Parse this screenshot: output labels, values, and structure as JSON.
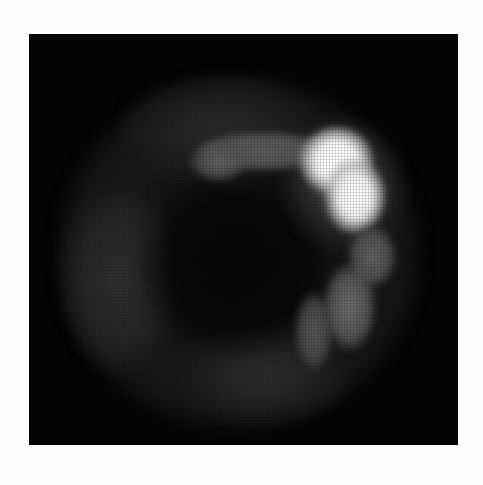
{
  "image": {
    "kind": "grayscale nuclear-medicine-style scan",
    "background_color": "#fdfdfd",
    "frame_color": "#030303",
    "hotspot_color": "#ffffff",
    "regions": [
      {
        "name": "bright-hotspot",
        "description": "intense uptake, upper right"
      },
      {
        "name": "horizontal-band",
        "description": "moderate uptake extending left from hotspot"
      },
      {
        "name": "right-lower-spots",
        "description": "three moderate uptake foci along right side"
      },
      {
        "name": "diffuse-background",
        "description": "faint circular halo of low uptake"
      }
    ]
  }
}
